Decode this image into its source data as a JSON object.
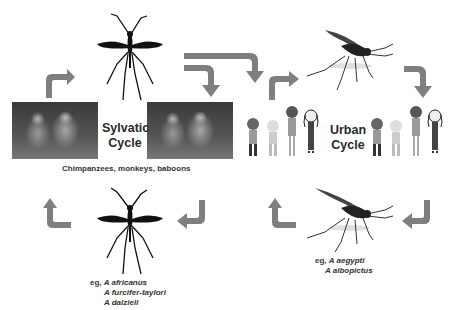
{
  "sylvatic": {
    "title_line1": "Sylvatic",
    "title_line2": "Cycle",
    "hosts_caption": "Chimpanzees, monkeys, baboons",
    "vector_prefix": "eg,",
    "vectors": [
      "A africanus",
      "A furcifer-taylori",
      "A dalzieli"
    ]
  },
  "urban": {
    "title_line1": "Urban",
    "title_line2": "Cycle",
    "vector_prefix": "eg,",
    "vectors": [
      "A aegypti",
      "A albopictus"
    ]
  },
  "colors": {
    "arrow": "#7f7f7f",
    "mosquito_silhouette": "#111111",
    "text": "#2a2a2a"
  },
  "icons": [
    "mosquito-silhouette-icon",
    "aedes-mosquito-icon",
    "curved-arrow-icon",
    "monkey-photo",
    "person-figure-icon"
  ]
}
